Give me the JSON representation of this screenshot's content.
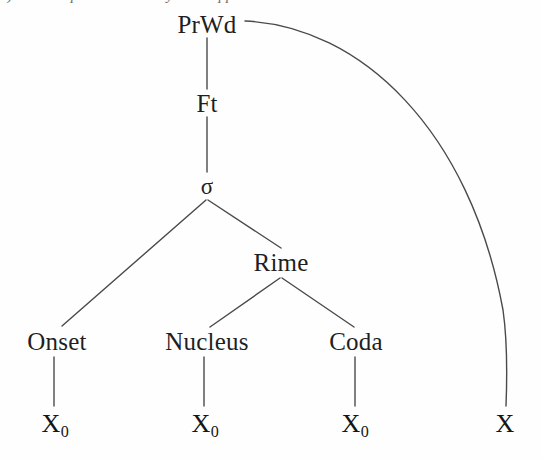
{
  "figure": {
    "type": "linguistic-tree",
    "caption_clipped": "a) Minimal prosodic word syllable appendix",
    "background_color": "#fefefe",
    "line_color": "#4a4a4a",
    "text_color": "#1c1c1c"
  },
  "nodes": {
    "prwd": {
      "label": "PrWd",
      "x": 207,
      "y": 24
    },
    "ft": {
      "label": "Ft",
      "x": 207,
      "y": 103
    },
    "sigma": {
      "label": "σ",
      "x": 207,
      "y": 186
    },
    "rime": {
      "label": "Rime",
      "x": 281,
      "y": 262
    },
    "onset": {
      "label": "Onset",
      "x": 57,
      "y": 341
    },
    "nucleus": {
      "label": "Nucleus",
      "x": 207,
      "y": 341
    },
    "coda": {
      "label": "Coda",
      "x": 356,
      "y": 341
    }
  },
  "terminals": [
    {
      "base": "X",
      "sub": "0",
      "x": 55,
      "y": 424,
      "name": "terminal-onset-x0"
    },
    {
      "base": "X",
      "sub": "0",
      "x": 205,
      "y": 424,
      "name": "terminal-nucleus-x0"
    },
    {
      "base": "X",
      "sub": "0",
      "x": 355,
      "y": 424,
      "name": "terminal-coda-x0"
    },
    {
      "base": "X",
      "sub": "",
      "x": 505,
      "y": 424,
      "name": "terminal-appendix-x"
    }
  ],
  "edges": [
    {
      "name": "edge-prwd-ft",
      "kind": "straight",
      "from": "PrWd",
      "to": "Ft"
    },
    {
      "name": "edge-ft-sigma",
      "kind": "straight",
      "from": "Ft",
      "to": "σ"
    },
    {
      "name": "edge-sigma-onset",
      "kind": "straight",
      "from": "σ",
      "to": "Onset"
    },
    {
      "name": "edge-sigma-rime",
      "kind": "straight",
      "from": "σ",
      "to": "Rime"
    },
    {
      "name": "edge-rime-nucleus",
      "kind": "straight",
      "from": "Rime",
      "to": "Nucleus"
    },
    {
      "name": "edge-rime-coda",
      "kind": "straight",
      "from": "Rime",
      "to": "Coda"
    },
    {
      "name": "edge-onset-x0",
      "kind": "straight",
      "from": "Onset",
      "to": "X0"
    },
    {
      "name": "edge-nucleus-x0",
      "kind": "straight",
      "from": "Nucleus",
      "to": "X0"
    },
    {
      "name": "edge-coda-x0",
      "kind": "straight",
      "from": "Coda",
      "to": "X0"
    },
    {
      "name": "edge-prwd-appendix",
      "kind": "curved",
      "from": "PrWd",
      "to": "X"
    }
  ]
}
